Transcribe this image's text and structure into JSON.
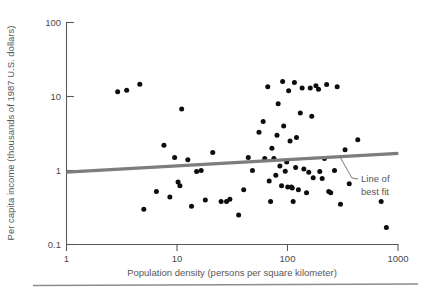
{
  "figure": {
    "background_color": "#ffffff",
    "point_color": "#0d0d0d",
    "fitline_color": "#7d7d7d",
    "axis_color": "#5a5a5a",
    "text_color": "#565656"
  },
  "axes": {
    "x_title": "Population density (persons per square kilometer)",
    "y_title": "Per capita income (thousands of 1987 U.S. dollars)",
    "x_ticks": [
      "1",
      "10",
      "100",
      "1000"
    ],
    "y_ticks": [
      "100",
      "10",
      "1",
      "0.1"
    ]
  },
  "annotations": {
    "fit_line_label_line1": "Line of",
    "fit_line_label_line2": "best fit"
  },
  "chart_data": {
    "type": "scatter",
    "title": "",
    "xlabel": "Population density (persons per square kilometer)",
    "ylabel": "Per capita income (thousands of 1987 U.S. dollars)",
    "xscale": "log",
    "yscale": "log",
    "xlim": [
      1,
      1000
    ],
    "ylim": [
      0.1,
      100
    ],
    "x_tick_values": [
      1,
      10,
      100,
      1000
    ],
    "y_tick_values": [
      0.1,
      1,
      10,
      100
    ],
    "grid": false,
    "legend": "none",
    "series": [
      {
        "name": "Countries",
        "marker": "circle",
        "color": "#0d0d0d",
        "points": [
          [
            2.9,
            11.6
          ],
          [
            3.5,
            12.1
          ],
          [
            4.6,
            14.6
          ],
          [
            5.0,
            0.3
          ],
          [
            6.5,
            0.52
          ],
          [
            7.6,
            2.2
          ],
          [
            8.6,
            0.44
          ],
          [
            9.5,
            1.5
          ],
          [
            10.2,
            0.7
          ],
          [
            10.6,
            0.62
          ],
          [
            11.0,
            6.8
          ],
          [
            12.5,
            1.4
          ],
          [
            13.5,
            0.33
          ],
          [
            15.0,
            0.97
          ],
          [
            16.5,
            1.0
          ],
          [
            18.0,
            0.4
          ],
          [
            21.0,
            1.75
          ],
          [
            25.0,
            0.38
          ],
          [
            28.0,
            0.38
          ],
          [
            30.0,
            0.41
          ],
          [
            36.0,
            0.25
          ],
          [
            40.0,
            0.55
          ],
          [
            44.0,
            1.5
          ],
          [
            48.0,
            1.0
          ],
          [
            55.0,
            3.3
          ],
          [
            60.0,
            4.6
          ],
          [
            62.0,
            1.45
          ],
          [
            66.0,
            13.5
          ],
          [
            68.0,
            0.72
          ],
          [
            70.0,
            0.38
          ],
          [
            72.0,
            2.0
          ],
          [
            75.0,
            1.45
          ],
          [
            78.0,
            0.86
          ],
          [
            80.0,
            3.0
          ],
          [
            82.0,
            8.0
          ],
          [
            85.0,
            1.15
          ],
          [
            88.0,
            0.62
          ],
          [
            90.0,
            16.0
          ],
          [
            92.0,
            4.0
          ],
          [
            95.0,
            0.98
          ],
          [
            98.0,
            1.3
          ],
          [
            100.0,
            0.6
          ],
          [
            102.0,
            12.0
          ],
          [
            105.0,
            2.5
          ],
          [
            108.0,
            0.6
          ],
          [
            110.0,
            0.58
          ],
          [
            112.0,
            0.38
          ],
          [
            115.0,
            15.5
          ],
          [
            118.0,
            1.1
          ],
          [
            120.0,
            2.8
          ],
          [
            125.0,
            0.55
          ],
          [
            130.0,
            6.0
          ],
          [
            135.0,
            13.0
          ],
          [
            140.0,
            1.05
          ],
          [
            148.0,
            0.5
          ],
          [
            155.0,
            0.95
          ],
          [
            160.0,
            13.0
          ],
          [
            165.0,
            5.4
          ],
          [
            170.0,
            0.8
          ],
          [
            180.0,
            14.0
          ],
          [
            190.0,
            12.5
          ],
          [
            195.0,
            0.97
          ],
          [
            205.0,
            0.78
          ],
          [
            215.0,
            1.45
          ],
          [
            225.0,
            14.5
          ],
          [
            235.0,
            0.52
          ],
          [
            245.0,
            0.5
          ],
          [
            265.0,
            1.0
          ],
          [
            280.0,
            13.5
          ],
          [
            300.0,
            0.35
          ],
          [
            330.0,
            1.9
          ],
          [
            360.0,
            0.66
          ],
          [
            430.0,
            2.6
          ],
          [
            700.0,
            0.38
          ],
          [
            780.0,
            0.17
          ]
        ]
      }
    ],
    "fit_line": {
      "label": "Line of best fit",
      "x_start": 1,
      "y_start": 0.95,
      "x_end": 1000,
      "y_end": 1.7
    }
  }
}
